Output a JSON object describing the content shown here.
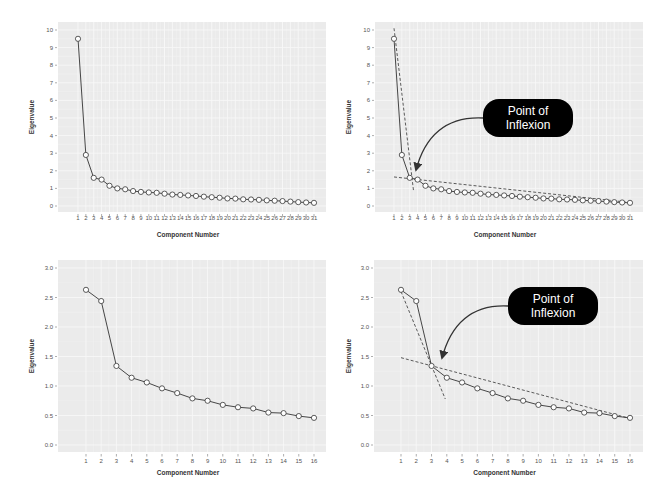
{
  "style": {
    "panel_bg": "#ebebeb",
    "grid_major": "#f7f7f7",
    "grid_minor": "#f2f2f2",
    "line_color": "#333333",
    "marker_fill": "#ffffff",
    "marker_stroke": "#333333",
    "dash_color": "#333333",
    "callout_bg": "#000000",
    "callout_text": "#ffffff"
  },
  "chart_data": [
    {
      "id": "scree-31-plain",
      "type": "line",
      "title": "",
      "xlabel": "Component Number",
      "ylabel": "Eigenvalue",
      "x": [
        1,
        2,
        3,
        4,
        5,
        6,
        7,
        8,
        9,
        10,
        11,
        12,
        13,
        14,
        15,
        16,
        17,
        18,
        19,
        20,
        21,
        22,
        23,
        24,
        25,
        26,
        27,
        28,
        29,
        30,
        31
      ],
      "series": [
        {
          "name": "Eigenvalue",
          "values": [
            9.5,
            2.9,
            1.6,
            1.5,
            1.15,
            1.0,
            0.95,
            0.85,
            0.8,
            0.77,
            0.75,
            0.7,
            0.65,
            0.63,
            0.6,
            0.57,
            0.53,
            0.5,
            0.47,
            0.43,
            0.42,
            0.38,
            0.37,
            0.35,
            0.32,
            0.3,
            0.28,
            0.25,
            0.22,
            0.2,
            0.18
          ]
        }
      ],
      "yticks": [
        0,
        1,
        2,
        3,
        4,
        5,
        6,
        7,
        8,
        9,
        10
      ],
      "ytick_labels": [
        "0",
        "1",
        "2",
        "3",
        "4",
        "5",
        "6",
        "7",
        "8",
        "9",
        "10"
      ],
      "xtick_labels": [
        "1",
        "2",
        "3",
        "4",
        "5",
        "6",
        "7",
        "8",
        "9",
        "10",
        "11",
        "12",
        "13",
        "14",
        "15",
        "16",
        "17",
        "18",
        "19",
        "20",
        "21",
        "22",
        "23",
        "24",
        "25",
        "26",
        "27",
        "28",
        "29",
        "30",
        "31"
      ],
      "ylim": [
        -0.4,
        10.6
      ],
      "grid": true,
      "legend": "none"
    },
    {
      "id": "scree-31-annotated",
      "type": "line",
      "title": "",
      "xlabel": "Component Number",
      "ylabel": "Eigenvalue",
      "x": [
        1,
        2,
        3,
        4,
        5,
        6,
        7,
        8,
        9,
        10,
        11,
        12,
        13,
        14,
        15,
        16,
        17,
        18,
        19,
        20,
        21,
        22,
        23,
        24,
        25,
        26,
        27,
        28,
        29,
        30,
        31
      ],
      "series": [
        {
          "name": "Eigenvalue",
          "values": [
            9.5,
            2.9,
            1.6,
            1.5,
            1.15,
            1.0,
            0.95,
            0.85,
            0.8,
            0.77,
            0.75,
            0.7,
            0.65,
            0.63,
            0.6,
            0.57,
            0.53,
            0.5,
            0.47,
            0.43,
            0.42,
            0.38,
            0.37,
            0.35,
            0.32,
            0.3,
            0.28,
            0.25,
            0.22,
            0.2,
            0.18
          ]
        }
      ],
      "dashed_lines": [
        {
          "name": "steep-tangent",
          "from": [
            1.0,
            10.1
          ],
          "to": [
            3.5,
            0.8
          ]
        },
        {
          "name": "shallow-tangent",
          "from": [
            1.0,
            1.65
          ],
          "to": [
            31.0,
            0.2
          ]
        }
      ],
      "annotation": {
        "text_line1": "Point of",
        "text_line2": "Inflexion",
        "box_px": [
          483,
          99,
          90,
          38
        ],
        "arrow_from_px": [
          483,
          118
        ],
        "arrow_to_px": [
          416,
          170
        ]
      },
      "yticks": [
        0,
        1,
        2,
        3,
        4,
        5,
        6,
        7,
        8,
        9,
        10
      ],
      "ytick_labels": [
        "0",
        "1",
        "2",
        "3",
        "4",
        "5",
        "6",
        "7",
        "8",
        "9",
        "10"
      ],
      "xtick_labels": [
        "1",
        "2",
        "3",
        "4",
        "5",
        "6",
        "7",
        "8",
        "9",
        "10",
        "11",
        "12",
        "13",
        "14",
        "15",
        "16",
        "17",
        "18",
        "19",
        "20",
        "21",
        "22",
        "23",
        "24",
        "25",
        "26",
        "27",
        "28",
        "29",
        "30",
        "31"
      ],
      "ylim": [
        -0.4,
        10.6
      ],
      "grid": true,
      "legend": "none"
    },
    {
      "id": "scree-16-plain",
      "type": "line",
      "title": "",
      "xlabel": "Component Number",
      "ylabel": "Eigenvalue",
      "x": [
        1,
        2,
        3,
        4,
        5,
        6,
        7,
        8,
        9,
        10,
        11,
        12,
        13,
        14,
        15,
        16
      ],
      "series": [
        {
          "name": "Eigenvalue",
          "values": [
            2.63,
            2.44,
            1.34,
            1.14,
            1.06,
            0.96,
            0.88,
            0.79,
            0.75,
            0.68,
            0.64,
            0.62,
            0.55,
            0.54,
            0.49,
            0.46
          ]
        }
      ],
      "yticks": [
        0.0,
        0.5,
        1.0,
        1.5,
        2.0,
        2.5,
        3.0
      ],
      "ytick_labels": [
        "0.0",
        "0.5",
        "1.0",
        "1.5",
        "2.0",
        "2.5",
        "3.0"
      ],
      "xtick_labels": [
        "1",
        "2",
        "3",
        "4",
        "5",
        "6",
        "7",
        "8",
        "9",
        "10",
        "11",
        "12",
        "13",
        "14",
        "15",
        "16"
      ],
      "ylim": [
        -0.12,
        3.15
      ],
      "grid": true,
      "legend": "none"
    },
    {
      "id": "scree-16-annotated",
      "type": "line",
      "title": "",
      "xlabel": "Component Number",
      "ylabel": "Eigenvalue",
      "x": [
        1,
        2,
        3,
        4,
        5,
        6,
        7,
        8,
        9,
        10,
        11,
        12,
        13,
        14,
        15,
        16
      ],
      "series": [
        {
          "name": "Eigenvalue",
          "values": [
            2.63,
            2.44,
            1.34,
            1.14,
            1.06,
            0.96,
            0.88,
            0.79,
            0.75,
            0.68,
            0.64,
            0.62,
            0.55,
            0.54,
            0.49,
            0.46
          ]
        }
      ],
      "dashed_lines": [
        {
          "name": "steep-tangent",
          "from": [
            1.0,
            2.6
          ],
          "to": [
            3.9,
            0.78
          ]
        },
        {
          "name": "shallow-tangent",
          "from": [
            1.0,
            1.48
          ],
          "to": [
            16.0,
            0.45
          ]
        }
      ],
      "annotation": {
        "text_line1": "Point of",
        "text_line2": "Inflexion",
        "box_px": [
          508,
          287,
          90,
          38
        ],
        "arrow_from_px": [
          508,
          306
        ],
        "arrow_to_px": [
          442,
          358
        ]
      },
      "yticks": [
        0.0,
        0.5,
        1.0,
        1.5,
        2.0,
        2.5,
        3.0
      ],
      "ytick_labels": [
        "0.0",
        "0.5",
        "1.0",
        "1.5",
        "2.0",
        "2.5",
        "3.0"
      ],
      "xtick_labels": [
        "1",
        "2",
        "3",
        "4",
        "5",
        "6",
        "7",
        "8",
        "9",
        "10",
        "11",
        "12",
        "13",
        "14",
        "15",
        "16"
      ],
      "ylim": [
        -0.12,
        3.15
      ],
      "grid": true,
      "legend": "none"
    }
  ],
  "layout": {
    "panels": [
      {
        "plot_px": [
          58,
          22,
          268,
          190
        ],
        "x_first_px": 78,
        "x_last_px": 314,
        "y_zero_px": 206,
        "y_top_tick_px": 30,
        "tick_label_y_px": 220,
        "xlabel_y_px": 237,
        "ylabel_x_px": 34
      },
      {
        "plot_px": [
          375,
          22,
          268,
          190
        ],
        "x_first_px": 394,
        "x_last_px": 630,
        "y_zero_px": 206,
        "y_top_tick_px": 30,
        "tick_label_y_px": 220,
        "xlabel_y_px": 237,
        "ylabel_x_px": 351
      },
      {
        "plot_px": [
          58,
          260,
          268,
          192
        ],
        "x_first_px": 86,
        "x_last_px": 314,
        "y_zero_px": 445,
        "y_top_tick_px": 268,
        "tick_label_y_px": 463,
        "xlabel_y_px": 475,
        "ylabel_x_px": 34
      },
      {
        "plot_px": [
          374,
          260,
          269,
          192
        ],
        "x_first_px": 401,
        "x_last_px": 630,
        "y_zero_px": 445,
        "y_top_tick_px": 268,
        "tick_label_y_px": 463,
        "xlabel_y_px": 475,
        "ylabel_x_px": 351
      }
    ]
  }
}
